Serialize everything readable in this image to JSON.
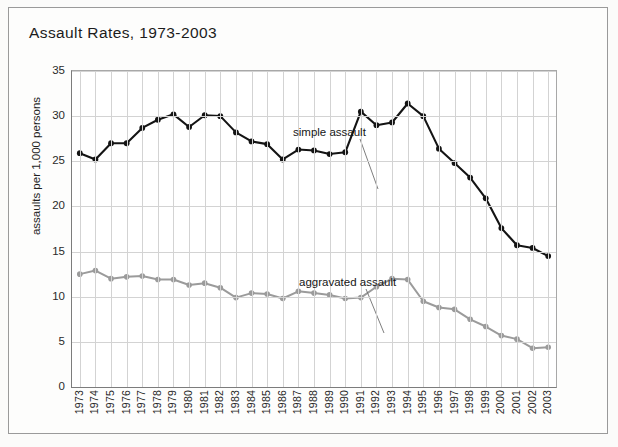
{
  "figure": {
    "title": "Assault Rates, 1973-2003",
    "background_color": "#fdfdfc",
    "frame_color": "#9a9a9a"
  },
  "chart_data": {
    "type": "line",
    "title": "Assault Rates, 1973-2003",
    "xlabel": "",
    "ylabel": "assaults per 1,000 persons",
    "xlim": [
      1973,
      2003
    ],
    "ylim": [
      0,
      35
    ],
    "yticks": [
      0,
      5,
      10,
      15,
      20,
      25,
      30,
      35
    ],
    "grid": true,
    "legend_position": "inline-annotations",
    "categories": [
      "1973",
      "1974",
      "1975",
      "1976",
      "1977",
      "1978",
      "1979",
      "1980",
      "1981",
      "1982",
      "1983",
      "1984",
      "1985",
      "1986",
      "1987",
      "1988",
      "1989",
      "1990",
      "1991",
      "1992",
      "1993",
      "1994",
      "1995",
      "1996",
      "1997",
      "1998",
      "1999",
      "2000",
      "2001",
      "2002",
      "2003"
    ],
    "series": [
      {
        "name": "simple assault",
        "color": "#141414",
        "marker": "circle",
        "values": [
          25.9,
          25.2,
          27.0,
          27.0,
          28.7,
          29.6,
          30.2,
          28.8,
          30.1,
          30.0,
          28.2,
          27.2,
          26.9,
          25.2,
          26.3,
          26.2,
          25.8,
          26.0,
          30.5,
          29.0,
          29.3,
          31.4,
          30.0,
          26.4,
          24.8,
          23.2,
          20.9,
          17.6,
          15.7,
          15.4,
          14.5
        ]
      },
      {
        "name": "aggravated assault",
        "color": "#9b9b9b",
        "marker": "circle",
        "values": [
          12.5,
          12.9,
          12.0,
          12.2,
          12.3,
          11.9,
          11.9,
          11.3,
          11.5,
          11.0,
          9.9,
          10.4,
          10.3,
          9.8,
          10.6,
          10.4,
          10.2,
          9.8,
          9.9,
          11.1,
          12.0,
          11.9,
          9.5,
          8.8,
          8.6,
          7.5,
          6.7,
          5.7,
          5.3,
          4.3,
          4.4
        ]
      }
    ],
    "annotations": [
      {
        "text": "simple assault",
        "series": "simple assault"
      },
      {
        "text": "aggravated assault",
        "series": "aggravated assault"
      }
    ]
  }
}
